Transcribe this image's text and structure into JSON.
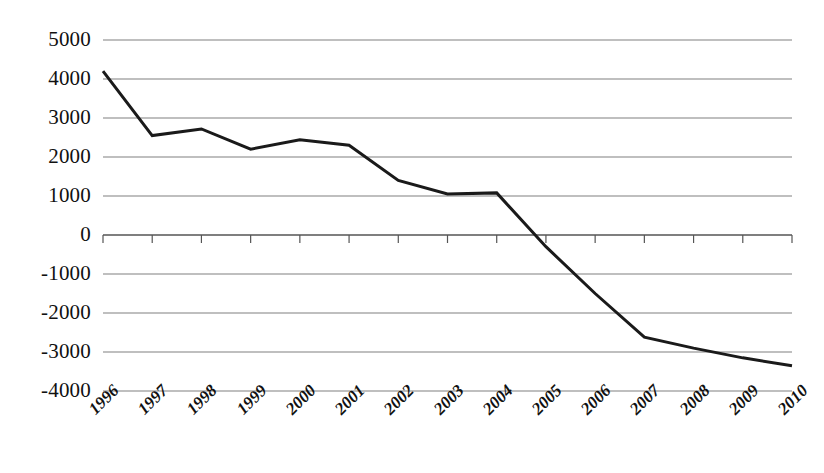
{
  "chart_data": {
    "type": "line",
    "title": "",
    "subtitle": "",
    "xlabel": "",
    "ylabel": "",
    "categories": [
      "1996",
      "1997",
      "1998",
      "1999",
      "2000",
      "2001",
      "2002",
      "2003",
      "2004",
      "2005",
      "2006",
      "2007",
      "2008",
      "2009",
      "2010"
    ],
    "series": [
      {
        "name": "Series 1",
        "values": [
          4200,
          2550,
          2720,
          2200,
          2440,
          2300,
          1400,
          1050,
          1080,
          -300,
          -1500,
          -2620,
          -2900,
          -3150,
          -3350
        ]
      }
    ],
    "ylim": [
      -4000,
      5000
    ],
    "yticks": [
      5000,
      4000,
      3000,
      2000,
      1000,
      0,
      -1000,
      -2000,
      -3000,
      -4000
    ],
    "ytick_labels": [
      "5000",
      "4000",
      "3000",
      "2000",
      "1000",
      "0",
      "-1000",
      "-2000",
      "-3000",
      "-4000"
    ],
    "xtick_labels": [
      "1996",
      "1997",
      "1998",
      "1999",
      "2000",
      "2001",
      "2002",
      "2003",
      "2004",
      "2005",
      "2006",
      "2007",
      "2008",
      "2009",
      "2010"
    ],
    "grid": true,
    "grid_axis": "y",
    "legend": false,
    "legend_position": "none",
    "annotations": [],
    "line_color": "#1a1a1a",
    "grid_color": "#808080",
    "background_color": "#ffffff",
    "axis_color": "#555555",
    "xtick_rotation": -45
  },
  "axes": {
    "y_axis_name": "value-axis",
    "x_axis_name": "year-axis",
    "zero_line_value": 0
  }
}
